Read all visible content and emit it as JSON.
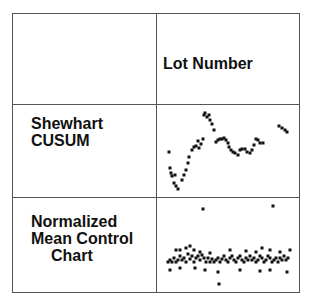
{
  "header": {
    "column_title": "Lot Number"
  },
  "rows": [
    {
      "label_lines": [
        "Shewhart",
        "CUSUM"
      ]
    },
    {
      "label_lines": [
        "Normalized",
        "Mean Control",
        "Chart"
      ]
    }
  ],
  "chart_data": [
    {
      "type": "scatter",
      "title": "Shewhart CUSUM",
      "xlabel": "Lot Number",
      "ylabel": "",
      "points": [
        [
          169,
          152
        ],
        [
          170,
          168
        ],
        [
          171,
          173
        ],
        [
          172,
          176
        ],
        [
          174,
          183
        ],
        [
          175,
          175
        ],
        [
          176,
          186
        ],
        [
          178,
          189
        ],
        [
          182,
          180
        ],
        [
          184,
          175
        ],
        [
          186,
          170
        ],
        [
          188,
          163
        ],
        [
          189,
          157
        ],
        [
          192,
          150
        ],
        [
          194,
          147
        ],
        [
          196,
          146
        ],
        [
          198,
          141
        ],
        [
          199,
          148
        ],
        [
          201,
          144
        ],
        [
          203,
          139
        ],
        [
          204,
          115
        ],
        [
          205,
          113
        ],
        [
          207,
          117
        ],
        [
          209,
          115
        ],
        [
          210,
          120
        ],
        [
          212,
          124
        ],
        [
          214,
          130
        ],
        [
          216,
          142
        ],
        [
          218,
          140
        ],
        [
          220,
          139
        ],
        [
          222,
          139
        ],
        [
          224,
          138
        ],
        [
          226,
          140
        ],
        [
          228,
          143
        ],
        [
          229,
          147
        ],
        [
          231,
          150
        ],
        [
          233,
          152
        ],
        [
          235,
          153
        ],
        [
          238,
          155
        ],
        [
          240,
          150
        ],
        [
          242,
          149
        ],
        [
          245,
          149
        ],
        [
          247,
          152
        ],
        [
          250,
          153
        ],
        [
          252,
          150
        ],
        [
          254,
          145
        ],
        [
          256,
          139
        ],
        [
          258,
          140
        ],
        [
          260,
          143
        ],
        [
          263,
          143
        ],
        [
          279,
          126
        ],
        [
          282,
          128
        ],
        [
          285,
          130
        ],
        [
          287,
          132
        ]
      ]
    },
    {
      "type": "scatter",
      "title": "Normalized Mean Control Chart",
      "xlabel": "Lot Number",
      "ylabel": "",
      "points": [
        [
          203,
          209
        ],
        [
          273,
          206
        ],
        [
          219,
          284
        ],
        [
          168,
          262
        ],
        [
          170,
          260
        ],
        [
          172,
          262
        ],
        [
          174,
          258
        ],
        [
          176,
          262
        ],
        [
          178,
          260
        ],
        [
          180,
          256
        ],
        [
          182,
          260
        ],
        [
          184,
          258
        ],
        [
          186,
          262
        ],
        [
          188,
          254
        ],
        [
          190,
          259
        ],
        [
          192,
          256
        ],
        [
          194,
          262
        ],
        [
          196,
          258
        ],
        [
          198,
          256
        ],
        [
          200,
          260
        ],
        [
          202,
          255
        ],
        [
          204,
          258
        ],
        [
          206,
          262
        ],
        [
          208,
          258
        ],
        [
          210,
          262
        ],
        [
          212,
          259
        ],
        [
          214,
          262
        ],
        [
          216,
          260
        ],
        [
          218,
          258
        ],
        [
          220,
          262
        ],
        [
          222,
          259
        ],
        [
          224,
          256
        ],
        [
          226,
          260
        ],
        [
          228,
          262
        ],
        [
          230,
          258
        ],
        [
          232,
          256
        ],
        [
          234,
          260
        ],
        [
          236,
          262
        ],
        [
          238,
          258
        ],
        [
          240,
          256
        ],
        [
          242,
          260
        ],
        [
          244,
          262
        ],
        [
          246,
          258
        ],
        [
          248,
          260
        ],
        [
          250,
          256
        ],
        [
          252,
          260
        ],
        [
          254,
          258
        ],
        [
          256,
          262
        ],
        [
          258,
          260
        ],
        [
          260,
          256
        ],
        [
          262,
          258
        ],
        [
          264,
          262
        ],
        [
          266,
          260
        ],
        [
          268,
          256
        ],
        [
          270,
          258
        ],
        [
          272,
          262
        ],
        [
          274,
          260
        ],
        [
          276,
          258
        ],
        [
          278,
          262
        ],
        [
          280,
          258
        ],
        [
          282,
          260
        ],
        [
          284,
          256
        ],
        [
          286,
          260
        ],
        [
          288,
          258
        ],
        [
          176,
          250
        ],
        [
          180,
          250
        ],
        [
          186,
          248
        ],
        [
          190,
          246
        ],
        [
          194,
          250
        ],
        [
          200,
          252
        ],
        [
          210,
          253
        ],
        [
          230,
          250
        ],
        [
          246,
          251
        ],
        [
          256,
          252
        ],
        [
          262,
          248
        ],
        [
          270,
          250
        ],
        [
          280,
          252
        ],
        [
          290,
          250
        ],
        [
          170,
          270
        ],
        [
          180,
          268
        ],
        [
          195,
          268
        ],
        [
          205,
          270
        ],
        [
          218,
          272
        ],
        [
          240,
          270
        ],
        [
          260,
          271
        ],
        [
          270,
          270
        ],
        [
          287,
          272
        ]
      ]
    }
  ]
}
